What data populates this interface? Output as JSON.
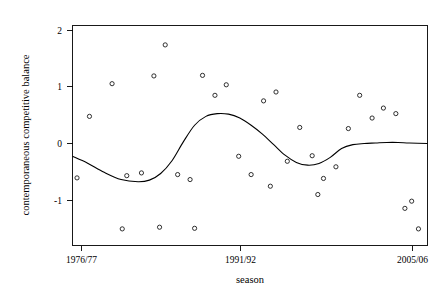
{
  "chart_data": {
    "type": "scatter",
    "title": "",
    "xlabel": "season",
    "ylabel": "contemporaneous competitive balance",
    "grid": false,
    "legend": null,
    "xtick_labels": [
      "1976/77",
      "1991/92",
      "2005/06"
    ],
    "xtick_values": [
      1976,
      1991,
      2005
    ],
    "ytick_labels": [
      "2",
      "1",
      "0",
      "-1"
    ],
    "ytick_values": [
      2,
      1,
      0,
      -1
    ],
    "xlim": [
      1975.2,
      2006.6
    ],
    "ylim": [
      -1.75,
      2.22
    ],
    "series": [
      {
        "name": "contemporaneous competitive balance",
        "marker": "open-circle",
        "x": [
          1975.6,
          1976.7,
          1978.7,
          1980.0,
          1981.3,
          1982.4,
          1983.4,
          1984.5,
          1985.6,
          1986.7,
          1987.8,
          1988.8,
          1989.9,
          1991.0,
          1992.1,
          1993.2,
          1994.2,
          1995.3,
          1996.4,
          1997.4,
          1998.5,
          1999.6,
          2000.6,
          2001.7,
          2002.7,
          2003.8,
          2004.6,
          2005.8,
          1979.6,
          1982.9,
          1986.0,
          1992.7,
          1996.9,
          2005.2
        ],
        "y": [
          -0.53,
          0.58,
          1.17,
          -0.49,
          -0.44,
          1.31,
          1.87,
          -0.47,
          -0.56,
          1.32,
          0.96,
          1.15,
          -0.14,
          -0.47,
          0.86,
          1.02,
          -0.23,
          0.38,
          -0.13,
          -0.54,
          -0.33,
          0.36,
          0.96,
          0.55,
          0.73,
          0.63,
          -1.08,
          -1.45,
          -1.45,
          -1.42,
          -1.44,
          -0.68,
          -0.83,
          -0.95
        ]
      }
    ],
    "smoother": {
      "name": "loess-smooth",
      "x": [
        1975.2,
        1976.5,
        1978.0,
        1979.5,
        1981.0,
        1982.0,
        1983.0,
        1984.0,
        1985.0,
        1986.0,
        1987.0,
        1988.0,
        1989.0,
        1990.0,
        1991.0,
        1992.0,
        1993.0,
        1994.0,
        1995.0,
        1996.0,
        1997.0,
        1998.0,
        1999.0,
        2000.0,
        2001.0,
        2002.0,
        2003.0,
        2004.0,
        2005.0,
        2006.6
      ],
      "y": [
        -0.14,
        -0.26,
        -0.43,
        -0.56,
        -0.6,
        -0.57,
        -0.45,
        -0.22,
        0.12,
        0.42,
        0.58,
        0.63,
        0.62,
        0.55,
        0.42,
        0.26,
        0.07,
        -0.12,
        -0.25,
        -0.3,
        -0.27,
        -0.16,
        0.0,
        0.07,
        0.09,
        0.1,
        0.11,
        0.11,
        0.1,
        0.09
      ]
    }
  }
}
